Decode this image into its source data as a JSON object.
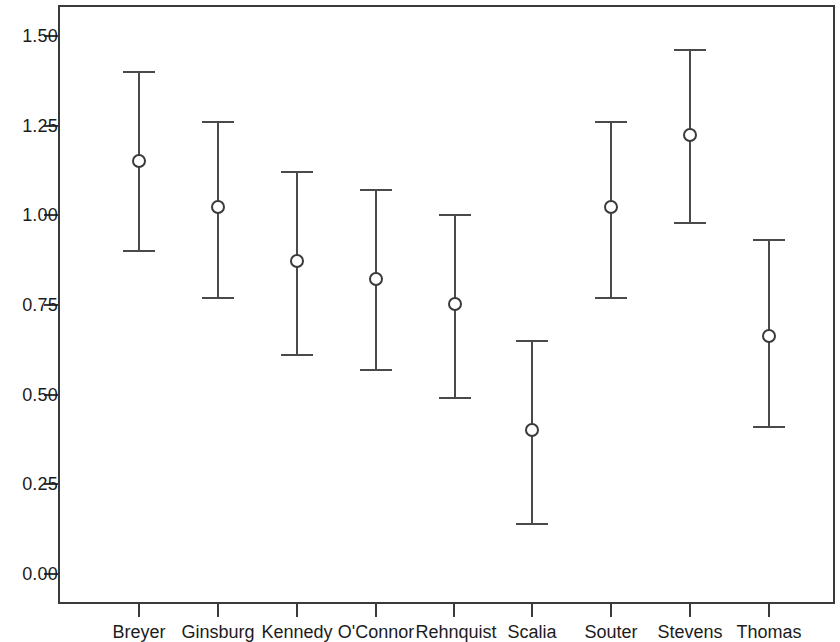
{
  "chart_data": {
    "type": "scatter",
    "title": "",
    "subtitle": "",
    "xlabel": "",
    "ylabel": "",
    "categories": [
      "Breyer",
      "Ginsburg",
      "Kennedy",
      "O'Connor",
      "Rehnquist",
      "Scalia",
      "Souter",
      "Stevens",
      "Thomas"
    ],
    "values": [
      1.15,
      1.02,
      0.87,
      0.82,
      0.75,
      0.4,
      1.02,
      1.22,
      0.66
    ],
    "ci_lower": [
      0.9,
      0.77,
      0.61,
      0.57,
      0.49,
      0.14,
      0.77,
      0.98,
      0.41
    ],
    "ci_upper": [
      1.4,
      1.26,
      1.12,
      1.07,
      1.0,
      0.65,
      1.26,
      1.46,
      0.93
    ],
    "ylim": [
      0.0,
      1.56
    ],
    "yticks": [
      0.0,
      0.25,
      0.5,
      0.75,
      1.0,
      1.25,
      1.5
    ],
    "ytick_labels": [
      "0.00",
      "0.25",
      "0.50",
      "0.75",
      "1.00",
      "1.25",
      "1.50"
    ],
    "grid": false,
    "legend": null,
    "marker": "open-circle",
    "error_bar_style": "capped-vertical",
    "annotations": []
  },
  "axis": {
    "y_tick_labels": [
      "1.50",
      "1.25",
      "1.00",
      "0.75",
      "0.50",
      "0.25",
      "0.00"
    ],
    "x_tick_labels": [
      "Breyer",
      "Ginsburg",
      "Kennedy",
      "O'Connor",
      "Rehnquist",
      "Scalia",
      "Souter",
      "Stevens",
      "Thomas"
    ]
  },
  "colors": {
    "axis": "#3a3a3a",
    "marker_edge": "#3a3a3a",
    "marker_face": "#ffffff",
    "errorbar": "#4a4a4a",
    "text": "#1c1c1c",
    "background": "#ffffff"
  }
}
